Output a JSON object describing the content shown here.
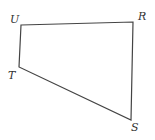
{
  "diagram": {
    "type": "quadrilateral",
    "vertices": [
      {
        "name": "U",
        "x": 21,
        "y": 25,
        "label_x": 10,
        "label_y": 23
      },
      {
        "name": "R",
        "x": 133,
        "y": 22,
        "label_x": 138,
        "label_y": 20
      },
      {
        "name": "S",
        "x": 131,
        "y": 120,
        "label_x": 131,
        "label_y": 131
      },
      {
        "name": "T",
        "x": 19,
        "y": 67,
        "label_x": 8,
        "label_y": 79
      }
    ],
    "edges": [
      [
        "U",
        "R"
      ],
      [
        "R",
        "S"
      ],
      [
        "S",
        "T"
      ],
      [
        "T",
        "U"
      ]
    ],
    "colors": {
      "stroke": "#444444",
      "label": "#333333",
      "background": "#ffffff"
    }
  }
}
